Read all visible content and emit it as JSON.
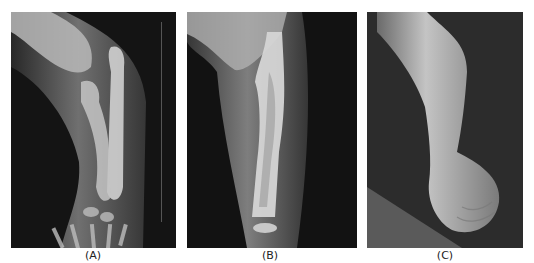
{
  "figure": {
    "panels": [
      {
        "id": "A",
        "label": "(A)",
        "description": "Lateral radiograph of infant forearm with bowed radius and ulna, elbow at top, wrist and hand bones at bottom"
      },
      {
        "id": "B",
        "label": "(B)",
        "description": "AP radiograph of forearm showing bowed bone with cortical thickening and dense shaft, elbow at top"
      },
      {
        "id": "C",
        "label": "(C)",
        "description": "Clinical photograph of infant's bowed forearm and hand against dark background"
      }
    ]
  }
}
